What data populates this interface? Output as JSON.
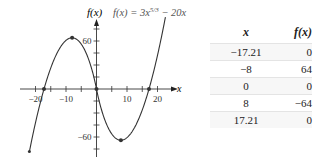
{
  "chart_data": {
    "type": "line",
    "title_parts": {
      "lhs": "f(x) = 3x",
      "exponent": "5/3",
      "rhs": " − 20x"
    },
    "xlabel": "x",
    "ylabel": "f(x)",
    "xlim": [
      -22,
      22.6
    ],
    "ylim": [
      -76,
      85
    ],
    "x_ticks": [
      -20,
      -15,
      -10,
      -5,
      0,
      5,
      10,
      15,
      20
    ],
    "x_tick_labels": [
      {
        "value": -20,
        "label": "−20"
      },
      {
        "value": -10,
        "label": "−10"
      },
      {
        "value": 10,
        "label": "10"
      },
      {
        "value": 20,
        "label": "20"
      }
    ],
    "y_ticks": [
      -75,
      -60,
      -45,
      -30,
      -15,
      15,
      30,
      45,
      60,
      75
    ],
    "y_tick_labels": [
      {
        "value": 60,
        "label": "60"
      },
      {
        "value": -60,
        "label": "−60"
      }
    ],
    "function": "3*sign(x)*|x|^(5/3) - 20*x",
    "series": [
      {
        "name": "f(x)",
        "x_range": [
          -22,
          22.6
        ]
      }
    ],
    "marked_points": [
      {
        "x": -17.21,
        "y": 0
      },
      {
        "x": -8,
        "y": 64
      },
      {
        "x": 0,
        "y": 0
      },
      {
        "x": 8,
        "y": -64
      },
      {
        "x": 17.21,
        "y": 0
      }
    ],
    "grid": false
  },
  "table": {
    "headers": [
      "x",
      "f(x)"
    ],
    "rows": [
      [
        "−17.21",
        "0"
      ],
      [
        "−8",
        "64"
      ],
      [
        "0",
        "0"
      ],
      [
        "8",
        "−64"
      ],
      [
        "17.21",
        "0"
      ]
    ]
  }
}
